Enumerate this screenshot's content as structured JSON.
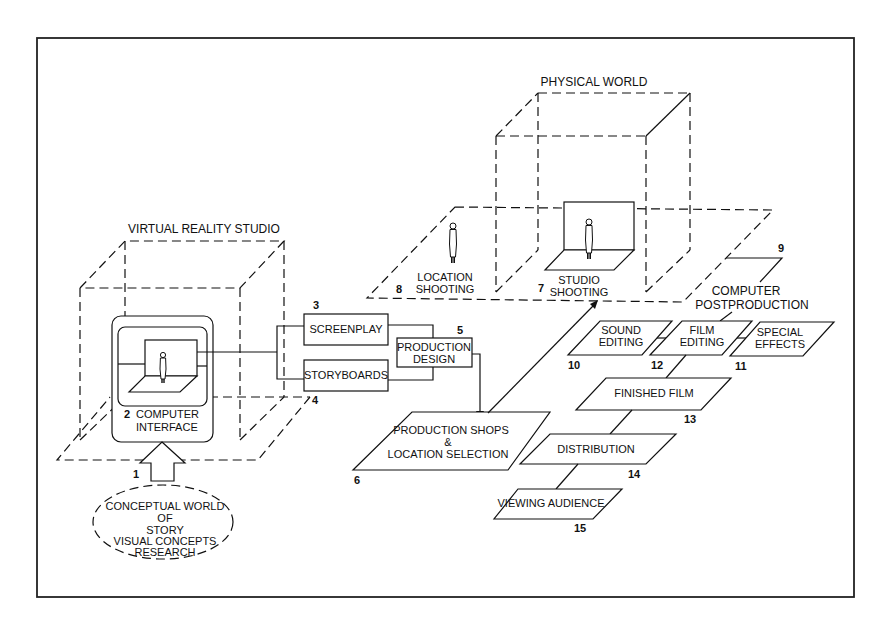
{
  "diagram": {
    "regions": {
      "virtual_reality_studio": "VIRTUAL REALITY STUDIO",
      "physical_world": "PHYSICAL WORLD"
    },
    "nodes": [
      {
        "id": "1",
        "number": "1",
        "lines": [
          "CONCEPTUAL WORLD",
          "OF",
          "STORY",
          "VISUAL CONCEPTS",
          "RESEARCH"
        ]
      },
      {
        "id": "2",
        "number": "2",
        "lines": [
          "COMPUTER",
          "INTERFACE"
        ]
      },
      {
        "id": "3",
        "number": "3",
        "lines": [
          "SCREENPLAY"
        ]
      },
      {
        "id": "4",
        "number": "4",
        "lines": [
          "STORYBOARDS"
        ]
      },
      {
        "id": "5",
        "number": "5",
        "lines": [
          "PRODUCTION",
          "DESIGN"
        ]
      },
      {
        "id": "6",
        "number": "6",
        "lines": [
          "PRODUCTION SHOPS",
          "&",
          "LOCATION SELECTION"
        ]
      },
      {
        "id": "7",
        "number": "7",
        "lines": [
          "STUDIO",
          "SHOOTING"
        ]
      },
      {
        "id": "8",
        "number": "8",
        "lines": [
          "LOCATION",
          "SHOOTING"
        ]
      },
      {
        "id": "9",
        "number": "9",
        "lines": [
          "COMPUTER",
          "POSTPRODUCTION"
        ]
      },
      {
        "id": "10",
        "number": "10",
        "lines": [
          "SOUND",
          "EDITING"
        ]
      },
      {
        "id": "11",
        "number": "11",
        "lines": [
          "SPECIAL",
          "EFFECTS"
        ]
      },
      {
        "id": "12",
        "number": "12",
        "lines": [
          "FILM",
          "EDITING"
        ]
      },
      {
        "id": "13",
        "number": "13",
        "lines": [
          "FINISHED FILM"
        ]
      },
      {
        "id": "14",
        "number": "14",
        "lines": [
          "DISTRIBUTION"
        ]
      },
      {
        "id": "15",
        "number": "15",
        "lines": [
          "VIEWING AUDIENCE"
        ]
      }
    ],
    "edges": [
      {
        "from": "1",
        "to": "2",
        "style": "block-arrow"
      },
      {
        "from": "2",
        "to": "3"
      },
      {
        "from": "2",
        "to": "4"
      },
      {
        "from": "3",
        "to": "5"
      },
      {
        "from": "4",
        "to": "5"
      },
      {
        "from": "5",
        "to": "6",
        "style": "arrow"
      },
      {
        "from": "6",
        "to": "7",
        "style": "arrow"
      },
      {
        "from": "9",
        "to": "12"
      },
      {
        "from": "10",
        "to": "12"
      },
      {
        "from": "11",
        "to": "12"
      },
      {
        "from": "12",
        "to": "13"
      },
      {
        "from": "13",
        "to": "14"
      },
      {
        "from": "14",
        "to": "15"
      }
    ],
    "icons": [
      "person-figure-icon",
      "studio-set-icon"
    ]
  }
}
